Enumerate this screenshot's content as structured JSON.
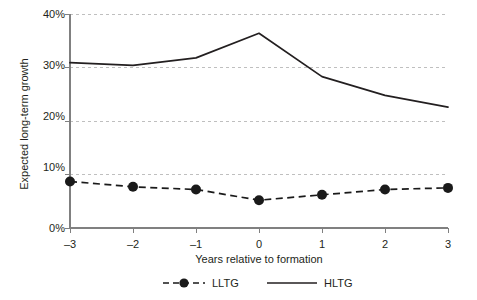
{
  "chart_data": {
    "type": "line",
    "title": "",
    "xlabel": "Years relative to formation",
    "ylabel": "Expected long-term growth",
    "x": [
      -3,
      -2,
      -1,
      0,
      1,
      2,
      3
    ],
    "categories": [
      "–3",
      "–2",
      "–1",
      "0",
      "1",
      "2",
      "3"
    ],
    "xlim": [
      -3,
      3
    ],
    "ylim": [
      0,
      40
    ],
    "yticks": [
      0,
      10,
      20,
      30,
      40
    ],
    "ytick_labels": [
      "0%",
      "10%",
      "20%",
      "30%",
      "40%"
    ],
    "grid": "horizontal-dashed",
    "legend_position": "bottom-center",
    "series": [
      {
        "name": "LLTG",
        "style": "dashed",
        "marker": "filled-circle",
        "color": "#1a1a1a",
        "values": [
          8.7,
          7.7,
          7.2,
          5.2,
          6.2,
          7.2,
          7.5
        ]
      },
      {
        "name": "HLTG",
        "style": "solid",
        "marker": "none",
        "color": "#231f20",
        "values": [
          30.9,
          30.4,
          31.8,
          36.4,
          28.3,
          24.8,
          22.6
        ]
      }
    ]
  },
  "axes": {
    "y_title": "Expected long-term growth",
    "x_title": "Years relative to formation",
    "y_tick_0": "0%",
    "y_tick_1": "10%",
    "y_tick_2": "20%",
    "y_tick_3": "30%",
    "y_tick_4": "40%",
    "x_tick_0": "–3",
    "x_tick_1": "–2",
    "x_tick_2": "–1",
    "x_tick_3": "0",
    "x_tick_4": "1",
    "x_tick_5": "2",
    "x_tick_6": "3"
  },
  "legend": {
    "entries": [
      {
        "label": "LLTG"
      },
      {
        "label": "HLTG"
      }
    ]
  },
  "colors": {
    "line": "#231f20",
    "grid": "#b8b8b8",
    "axis": "#808080",
    "background": "#ffffff"
  }
}
